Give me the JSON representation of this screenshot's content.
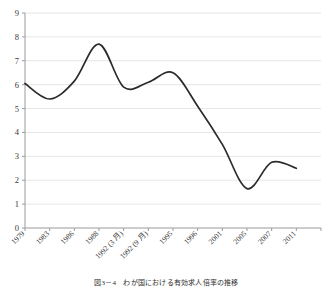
{
  "figure": {
    "caption": "図3－4　わが国における有効求人倍率の推移"
  },
  "chart_data": {
    "type": "line",
    "title": "",
    "xlabel": "",
    "ylabel": "",
    "grid": true,
    "legend": "none",
    "line_color": "#2b2b2b",
    "grid_color": "#e6e6e6",
    "axis_color": "#9a9a9a",
    "ylim": [
      0,
      9
    ],
    "yticks": [
      0,
      1,
      2,
      3,
      4,
      5,
      6,
      7,
      8,
      9
    ],
    "ytick_labels": [
      "0",
      "1",
      "2",
      "3",
      "4",
      "5",
      "6",
      "7",
      "8",
      "9"
    ],
    "categories": [
      "1979",
      "1983",
      "1986",
      "1988",
      "1992 (3 月)",
      "1992 (9 月)",
      "1995",
      "1996",
      "2001",
      "2005",
      "2007",
      "2011"
    ],
    "values": [
      6.05,
      5.4,
      6.15,
      7.7,
      5.9,
      6.1,
      6.5,
      5.1,
      3.5,
      1.65,
      2.75,
      2.5
    ],
    "series": [
      {
        "name": "",
        "values": [
          6.05,
          5.4,
          6.15,
          7.7,
          5.9,
          6.1,
          6.5,
          5.1,
          3.5,
          1.65,
          2.75,
          2.5
        ]
      }
    ],
    "xtick_rotation": -45,
    "smoothing": "spline"
  }
}
